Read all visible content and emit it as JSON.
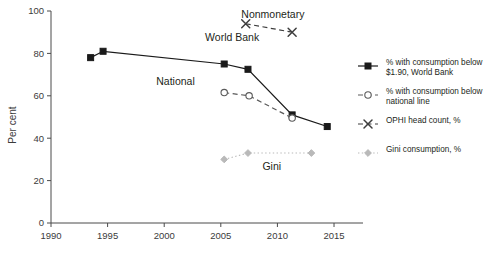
{
  "chart_data": {
    "type": "line",
    "title": "",
    "xlabel": "",
    "ylabel": "Per cent",
    "xlim": [
      1990,
      2016.5
    ],
    "ylim": [
      0,
      100
    ],
    "grid": false,
    "legend_position": "right",
    "x_ticks": [
      "1990",
      "1995",
      "2000",
      "2005",
      "2010",
      "2015"
    ],
    "x_tick_values": [
      1990,
      1995,
      2000,
      2005,
      2010,
      2015
    ],
    "y_ticks": [
      "0",
      "20",
      "40",
      "60",
      "80",
      "100"
    ],
    "y_tick_values": [
      0,
      20,
      40,
      60,
      80,
      100
    ],
    "series": [
      {
        "name": "% with consumption below $1.90, World Bank",
        "short_name": "World Bank",
        "marker": "filled-square",
        "line": "solid",
        "color": "#1a1a1a",
        "x": [
          1993.5,
          1994.6,
          2005.3,
          2007.4,
          2011.3,
          2014.4
        ],
        "values": [
          78,
          81,
          75,
          72.5,
          51,
          45.5
        ]
      },
      {
        "name": "% with consumption below national line",
        "short_name": "National",
        "marker": "open-circle",
        "line": "dashed",
        "color": "#5a5a5a",
        "x": [
          2005.3,
          2007.5,
          2011.3
        ],
        "values": [
          61.5,
          60,
          49.5
        ]
      },
      {
        "name": "OPHI head count, %",
        "short_name": "Nonmonetary",
        "marker": "cross",
        "line": "dashed",
        "color": "#3d3d3d",
        "x": [
          2007.2,
          2011.3
        ],
        "values": [
          94,
          90
        ]
      },
      {
        "name": "Gini consumption, %",
        "short_name": "Gini",
        "marker": "filled-diamond",
        "line": "dotted",
        "color": "#b9b9b9",
        "x": [
          2005.3,
          2007.4,
          2013.0
        ],
        "values": [
          30,
          33,
          33
        ]
      }
    ],
    "inline_annotations": [
      {
        "text": "World Bank",
        "x": 2006.0,
        "y": 86
      },
      {
        "text": "National",
        "x": 2001.0,
        "y": 65
      },
      {
        "text": "Nonmonetary",
        "x": 2009.6,
        "y": 96.5
      },
      {
        "text": "Gini",
        "x": 2009.5,
        "y": 25
      }
    ],
    "legend": [
      {
        "label_line1": "% with consumption below",
        "label_line2": "$1.90, World Bank",
        "marker": "filled-square",
        "line": "solid",
        "color": "#1a1a1a"
      },
      {
        "label_line1": "% with consumption below",
        "label_line2": "national line",
        "marker": "open-circle",
        "line": "dashed",
        "color": "#5a5a5a"
      },
      {
        "label_line1": "OPHI head count, %",
        "label_line2": "",
        "marker": "cross",
        "line": "dashed",
        "color": "#3d3d3d"
      },
      {
        "label_line1": "Gini consumption, %",
        "label_line2": "",
        "marker": "filled-diamond",
        "line": "dotted",
        "color": "#b9b9b9"
      }
    ]
  }
}
